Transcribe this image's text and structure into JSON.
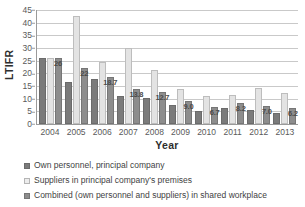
{
  "chart_data": {
    "type": "bar",
    "title": "",
    "xlabel": "Year",
    "ylabel": "LTIFR",
    "categories": [
      "2004",
      "2005",
      "2006",
      "2007",
      "2008",
      "2009",
      "2010",
      "2011",
      "2012",
      "2013"
    ],
    "ylim": [
      0,
      45
    ],
    "ytick_step": 5,
    "yticks": [
      "45",
      "40",
      "35",
      "30",
      "25",
      "20",
      "15",
      "10",
      "5",
      "0"
    ],
    "grid": true,
    "legend_position": "bottom-left",
    "series": [
      {
        "name": "Own personnel, principal company",
        "color": "#7b7b7b",
        "values": [
          26.2,
          16.4,
          17.8,
          11.2,
          10.1,
          7.6,
          5.2,
          6.5,
          5.4,
          4.4
        ],
        "labels": [
          "",
          "",
          "",
          "",
          "",
          "",
          "",
          "",
          "",
          ""
        ]
      },
      {
        "name": "Suppliers in principal company's premises",
        "color": "#e3e3e3",
        "values": [
          26.2,
          42.7,
          24.3,
          30.0,
          21.5,
          13.8,
          11.0,
          11.6,
          14.3,
          12.1
        ],
        "labels": [
          "",
          "",
          "",
          "",
          "",
          "",
          "",
          "",
          "",
          ""
        ]
      },
      {
        "name": "Combined (own personnel and suppliers) in shared workplace",
        "color": "#8d8d8d",
        "values": [
          26.0,
          22.0,
          18.7,
          13.8,
          12.7,
          9.0,
          6.7,
          8.2,
          7.0,
          6.2
        ],
        "labels": [
          "26",
          "22",
          "18.7",
          "13.8",
          "12.7",
          "9.0",
          "6.7",
          "8.2",
          "7.0",
          "6.2"
        ]
      }
    ]
  }
}
